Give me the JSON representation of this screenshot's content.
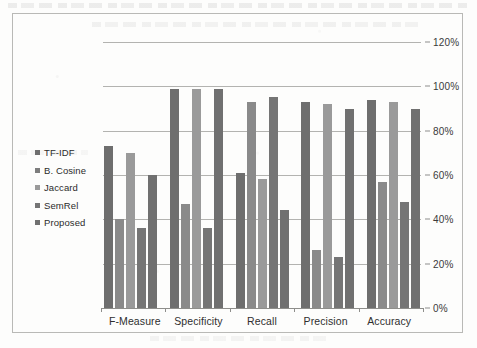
{
  "chart_data": {
    "type": "bar",
    "title": "",
    "xlabel": "",
    "ylabel": "",
    "ylim": [
      0,
      120
    ],
    "ytick_labels": [
      "120%",
      "100%",
      "80%",
      "60%",
      "40%",
      "20%",
      "0%"
    ],
    "ytick_values": [
      120,
      100,
      80,
      60,
      40,
      20,
      0
    ],
    "yaxis_position": "right",
    "grid": true,
    "legend_position": "left",
    "categories": [
      "F-Measure",
      "Specificity",
      "Recall",
      "Precision",
      "Accuracy"
    ],
    "series": [
      {
        "name": "TF-IDF",
        "color": "#6e6e6e",
        "values": [
          73,
          99,
          61,
          93,
          94
        ]
      },
      {
        "name": "B. Cosine",
        "color": "#8a8a8a",
        "values": [
          40,
          47,
          93,
          26,
          57
        ]
      },
      {
        "name": "Jaccard",
        "color": "#9a9a9a",
        "values": [
          70,
          99,
          58,
          92,
          93
        ]
      },
      {
        "name": "SemRel",
        "color": "#757575",
        "values": [
          36,
          36,
          95,
          23,
          48
        ]
      },
      {
        "name": "Proposed",
        "color": "#707070",
        "values": [
          60,
          99,
          44,
          90,
          90
        ]
      }
    ]
  },
  "legend": {
    "items": [
      {
        "label": "TF-IDF",
        "color": "#6e6e6e"
      },
      {
        "label": "B. Cosine",
        "color": "#7d7d7d"
      },
      {
        "label": "Jaccard",
        "color": "#9a9a9a"
      },
      {
        "label": "SemRel",
        "color": "#757575"
      },
      {
        "label": "Proposed",
        "color": "#707070"
      }
    ]
  },
  "colors": {
    "frame_border": "#b9b9b6",
    "gridline": "#b3b3b0",
    "axis_line": "#8e8e8b",
    "text": "#2f2f2f",
    "background": "#fdfdfc"
  }
}
